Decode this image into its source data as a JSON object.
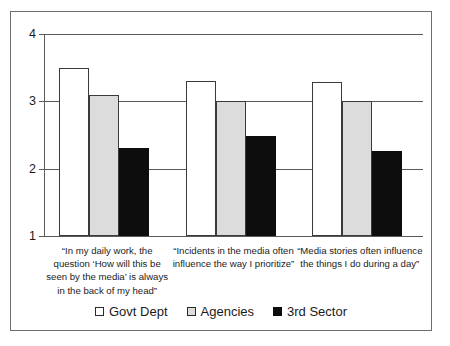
{
  "chart_data": {
    "type": "bar",
    "title": "",
    "subtitle": "",
    "xlabel": "",
    "ylabel": "",
    "ylim": [
      1,
      4
    ],
    "yticks": [
      1,
      2,
      3,
      4
    ],
    "ytick_labels": [
      "1",
      "2",
      "3",
      "4"
    ],
    "grid": true,
    "legend_position": "bottom",
    "categories": [
      "“In my daily work, the question ‘How will this be seen by the media’ is always in the back of my head”",
      "“Incidents in the media often influence the way I prioritize”",
      "“Media stories often influence the things I do during a day”"
    ],
    "series": [
      {
        "name": "Govt Dept",
        "color": "#ffffff",
        "values": [
          3.5,
          3.3,
          3.28
        ]
      },
      {
        "name": "Agencies",
        "color": "#dcdcdc",
        "values": [
          3.1,
          3.0,
          3.0
        ]
      },
      {
        "name": "3rd Sector",
        "color": "#0d0d0d",
        "values": [
          2.3,
          2.48,
          2.27
        ]
      }
    ]
  },
  "legend": {
    "items": [
      {
        "label": "Govt Dept",
        "swatch": "legend-swatch-white"
      },
      {
        "label": "Agencies",
        "swatch": "legend-swatch-gray"
      },
      {
        "label": "3rd Sector",
        "swatch": "legend-swatch-black"
      }
    ]
  },
  "frame": {
    "border_color": "#6d6d6d",
    "background": "#ffffff"
  }
}
